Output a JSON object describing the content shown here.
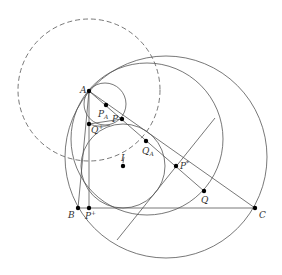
{
  "figure": {
    "stroke_color": "#555555",
    "point_color": "#000000",
    "points": [
      {
        "id": "A",
        "label": "A",
        "sub": "",
        "sup": ""
      },
      {
        "id": "B",
        "label": "B",
        "sub": "",
        "sup": ""
      },
      {
        "id": "C",
        "label": "C",
        "sub": "",
        "sup": ""
      },
      {
        "id": "P+",
        "label": "P",
        "sub": "",
        "sup": "+"
      },
      {
        "id": "PA",
        "label": "P",
        "sub": "A",
        "sup": ""
      },
      {
        "id": "P",
        "label": "P",
        "sub": "",
        "sup": ""
      },
      {
        "id": "Q+",
        "label": "Q",
        "sub": "",
        "sup": "+"
      },
      {
        "id": "QA",
        "label": "Q",
        "sub": "A",
        "sup": ""
      },
      {
        "id": "I",
        "label": "I",
        "sub": "",
        "sup": ""
      },
      {
        "id": "P*",
        "label": "P",
        "sub": "",
        "sup": "*"
      },
      {
        "id": "Q",
        "label": "Q",
        "sub": "",
        "sup": ""
      }
    ],
    "segments": [
      [
        "A",
        "B"
      ],
      [
        "A",
        "C"
      ],
      [
        "B",
        "C"
      ],
      [
        "A",
        "P+"
      ],
      [
        "P",
        "Q"
      ],
      [
        "Q+",
        "P"
      ]
    ],
    "circles": [
      {
        "id": "dashed-circle",
        "style": "dashed"
      },
      {
        "id": "outer-circle",
        "style": "solid"
      },
      {
        "id": "middle-circle",
        "style": "solid"
      },
      {
        "id": "incircle",
        "style": "solid"
      },
      {
        "id": "small-circle-A",
        "style": "solid"
      }
    ]
  }
}
